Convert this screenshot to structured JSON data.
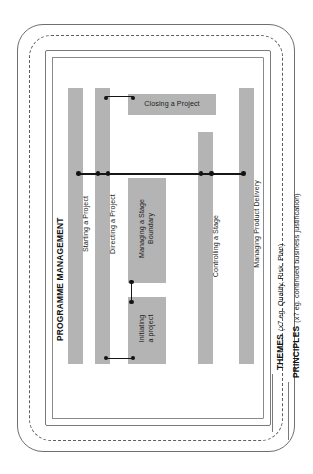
{
  "diagram": {
    "type": "nested-process-diagram",
    "colors": {
      "bar_fill": "#b4b4b4",
      "connector": "#131313",
      "frame_solid": "#6f6f6f",
      "frame_dashed": "#5f5f5f",
      "text": "#1c1c1c",
      "background": "#ffffff"
    }
  },
  "frames": [
    {
      "id": "principles",
      "style": "solid-rounded",
      "caption_strong": "PRINCIPLES",
      "caption_light": "(x7 eg. continued business justification)"
    },
    {
      "id": "themes",
      "style": "dashed-rounded",
      "caption_strong": "THEMES",
      "caption_light": "(x7 eg. Quality, Risk, Plan)"
    },
    {
      "id": "programme",
      "style": "solid-rect",
      "caption_strong": "PROGRAMME MANAGEMENT",
      "caption_light": ""
    },
    {
      "id": "project",
      "style": "solid-rect",
      "caption_strong": "",
      "caption_light": ""
    }
  ],
  "processes": [
    {
      "id": "starting-a-project",
      "label": "Starting a Project",
      "orientation": "vertical"
    },
    {
      "id": "directing-a-project",
      "label": "Directing a Project",
      "orientation": "vertical"
    },
    {
      "id": "closing-a-project",
      "label": "Closing a Project",
      "orientation": "horizontal"
    },
    {
      "id": "managing-a-stage-boundary",
      "label": "Managing a Stage\nBoundary",
      "orientation": "vertical"
    },
    {
      "id": "initiating-a-project",
      "label": "Initiating\na project",
      "orientation": "vertical"
    },
    {
      "id": "controlling-a-stage",
      "label": "Controlling a Stage",
      "orientation": "vertical"
    },
    {
      "id": "managing-product-delivery",
      "label": "Managing Product Delivery",
      "orientation": "vertical"
    }
  ],
  "side_captions": {
    "programme_management": "PROGRAMME MANAGEMENT",
    "themes_strong": "THEMES",
    "themes_light": "(x7 eg. Quality, Risk, Plan)",
    "principles_strong": "PRINCIPLES",
    "principles_light": "(x7 eg. continued business justification)"
  },
  "connectors": [
    {
      "id": "directing-to-closing",
      "from": "directing-a-project",
      "to": "closing-a-project"
    },
    {
      "id": "main-horizontal-link",
      "from": "starting-a-project",
      "to": "managing-product-delivery"
    },
    {
      "id": "boundary-to-initiating",
      "from": "managing-a-stage-boundary",
      "to": "initiating-a-project"
    },
    {
      "id": "directing-to-initiating",
      "from": "directing-a-project",
      "to": "initiating-a-project"
    }
  ]
}
